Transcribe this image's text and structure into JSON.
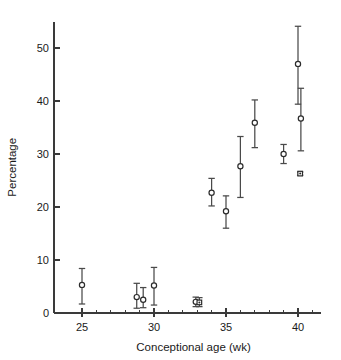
{
  "chart_data": {
    "type": "scatter",
    "title": "",
    "subtitle": "",
    "xlabel": "Conceptional age (wk)",
    "ylabel": "Percentage",
    "xlim": [
      24.0,
      41.6
    ],
    "ylim": [
      0,
      55
    ],
    "grid": false,
    "legend": "none",
    "x_ticks_major": [
      25,
      30,
      35,
      40
    ],
    "x_ticklabels": [
      "25",
      "30",
      "35",
      "40"
    ],
    "x_ticks_minor": [
      26,
      27,
      28,
      29,
      31,
      32,
      33,
      34,
      36,
      37,
      38,
      39,
      41
    ],
    "y_ticks_major": [
      0,
      10,
      20,
      30,
      40,
      50
    ],
    "y_ticklabels": [
      "0",
      "10",
      "20",
      "30",
      "40",
      "50"
    ],
    "error_style": "vertical error bars with caps",
    "marker_shapes": [
      "circle",
      "square"
    ],
    "points": [
      {
        "x": 25.0,
        "y": 5.3,
        "lo": 1.7,
        "hi": 8.4,
        "marker": "circle"
      },
      {
        "x": 28.8,
        "y": 3.0,
        "lo": 0.9,
        "hi": 5.6,
        "marker": "circle"
      },
      {
        "x": 29.25,
        "y": 2.5,
        "lo": 1.0,
        "hi": 4.8,
        "marker": "circle"
      },
      {
        "x": 30.0,
        "y": 5.2,
        "lo": 1.5,
        "hi": 8.6,
        "marker": "circle"
      },
      {
        "x": 32.9,
        "y": 2.1,
        "lo": 1.2,
        "hi": 3.0,
        "marker": "circle"
      },
      {
        "x": 33.15,
        "y": 2.0,
        "lo": 1.2,
        "hi": 2.9,
        "marker": "square"
      },
      {
        "x": 34.0,
        "y": 22.7,
        "lo": 20.2,
        "hi": 25.4,
        "marker": "circle"
      },
      {
        "x": 35.0,
        "y": 19.2,
        "lo": 16.0,
        "hi": 22.1,
        "marker": "circle"
      },
      {
        "x": 36.0,
        "y": 27.7,
        "lo": 21.8,
        "hi": 33.3,
        "marker": "circle"
      },
      {
        "x": 37.0,
        "y": 35.9,
        "lo": 31.2,
        "hi": 40.2,
        "marker": "circle"
      },
      {
        "x": 39.0,
        "y": 30.0,
        "lo": 28.2,
        "hi": 31.8,
        "marker": "circle"
      },
      {
        "x": 40.0,
        "y": 47.0,
        "lo": 39.4,
        "hi": 54.1,
        "marker": "circle"
      },
      {
        "x": 40.2,
        "y": 36.7,
        "lo": 30.6,
        "hi": 42.4,
        "marker": "circle"
      },
      {
        "x": 40.15,
        "y": 26.3,
        "lo": 26.0,
        "hi": 26.6,
        "marker": "square"
      }
    ]
  }
}
